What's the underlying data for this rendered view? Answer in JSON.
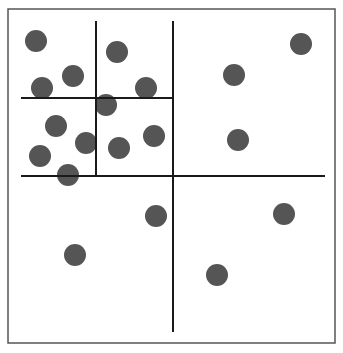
{
  "diagram": {
    "type": "spatial-partition-quadtree",
    "frame": {
      "x": 8,
      "y": 9,
      "width": 327,
      "height": 334,
      "stroke": "#555555"
    },
    "colors": {
      "background": "#ffffff",
      "point": "#555555",
      "line": "#1a1a1a"
    },
    "point_radius": 11,
    "lines": [
      {
        "id": "h-main",
        "x1": 21,
        "y1": 176,
        "x2": 325,
        "y2": 176
      },
      {
        "id": "v-main",
        "x1": 173,
        "y1": 21,
        "x2": 173,
        "y2": 332
      },
      {
        "id": "h-sub",
        "x1": 21,
        "y1": 98,
        "x2": 173,
        "y2": 98
      },
      {
        "id": "v-sub",
        "x1": 96,
        "y1": 21,
        "x2": 96,
        "y2": 176
      }
    ],
    "points": [
      {
        "x": 36,
        "y": 41
      },
      {
        "x": 117,
        "y": 52
      },
      {
        "x": 73,
        "y": 76
      },
      {
        "x": 42,
        "y": 88
      },
      {
        "x": 146,
        "y": 88
      },
      {
        "x": 106,
        "y": 105
      },
      {
        "x": 56,
        "y": 126
      },
      {
        "x": 86,
        "y": 143
      },
      {
        "x": 40,
        "y": 156
      },
      {
        "x": 119,
        "y": 148
      },
      {
        "x": 154,
        "y": 136
      },
      {
        "x": 68,
        "y": 175
      },
      {
        "x": 301,
        "y": 44
      },
      {
        "x": 234,
        "y": 75
      },
      {
        "x": 238,
        "y": 140
      },
      {
        "x": 156,
        "y": 216
      },
      {
        "x": 284,
        "y": 214
      },
      {
        "x": 75,
        "y": 255
      },
      {
        "x": 217,
        "y": 275
      }
    ]
  }
}
